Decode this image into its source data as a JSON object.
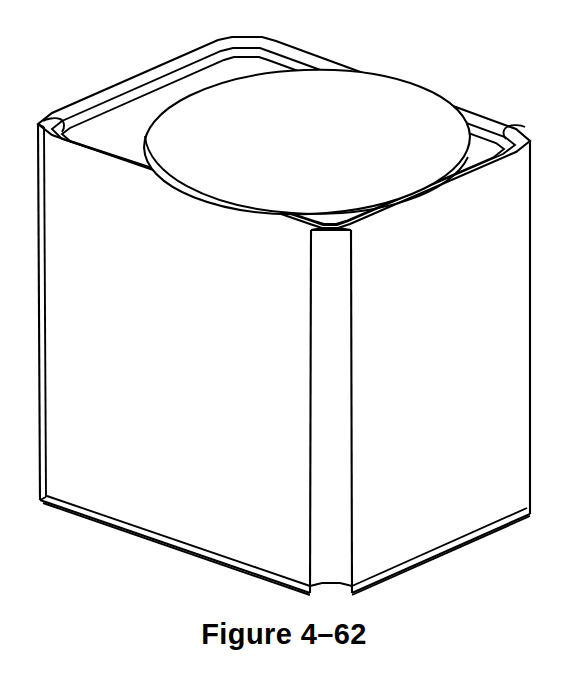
{
  "document": {
    "type": "technical-drawing",
    "background_color": "#ffffff",
    "line_color": "#000000"
  },
  "caption": {
    "text": "Figure 4–62",
    "figure_word": "Figure",
    "figure_number": "4–62"
  },
  "drawing": {
    "title": "isometric-view-of-chamfered-cube-with-circular-boss",
    "projection": "isometric",
    "object_name": "chamfered cube with circular boss on top face",
    "features": [
      "chamfered top perimeter edges",
      "chamfered vertical corner edges",
      "chamfered bottom perimeter edge",
      "large circular boss centered on top face"
    ],
    "stroke_color": "#000000",
    "fill_color": "#ffffff",
    "stroke_width": 2.1
  }
}
